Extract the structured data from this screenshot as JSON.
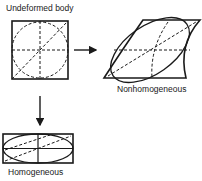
{
  "labels": {
    "undeformed": "Undeformed body",
    "nonhomogeneous": "Nonhomogeneous",
    "homogeneous": "Homogeneous"
  },
  "colors": {
    "stroke": "#1a1a1a",
    "background": "#ffffff"
  }
}
